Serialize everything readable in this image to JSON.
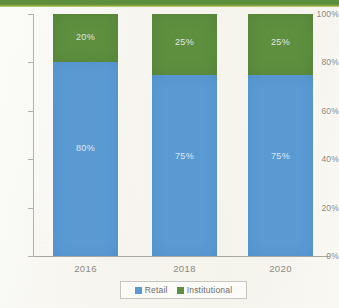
{
  "chart_data": {
    "type": "bar",
    "subtype": "stacked-100-percent",
    "title": "",
    "xlabel": "",
    "ylabel": "",
    "categories": [
      "2016",
      "2018",
      "2020"
    ],
    "series": [
      {
        "name": "Retail",
        "color": "#5b9bd5",
        "values": [
          80,
          75,
          75
        ],
        "labels": [
          "80%",
          "75%",
          "75%"
        ]
      },
      {
        "name": "Institutional",
        "color": "#5f9040",
        "values": [
          20,
          25,
          25
        ],
        "labels": [
          "20%",
          "25%",
          "25%"
        ]
      }
    ],
    "ylim": [
      0,
      100
    ],
    "yticks": [
      0,
      20,
      40,
      60,
      80,
      100
    ],
    "ytick_labels": [
      "0%",
      "20%",
      "40%",
      "60%",
      "80%",
      "100%"
    ],
    "grid": false,
    "legend_position": "bottom"
  },
  "legend": {
    "items": [
      {
        "label": "Retail",
        "color": "#5b9bd5"
      },
      {
        "label": "Institutional",
        "color": "#5f9040"
      }
    ]
  },
  "decoration": {
    "top_band_color": "#5d8e3b",
    "top_band_accent_color": "#cddc7a"
  }
}
